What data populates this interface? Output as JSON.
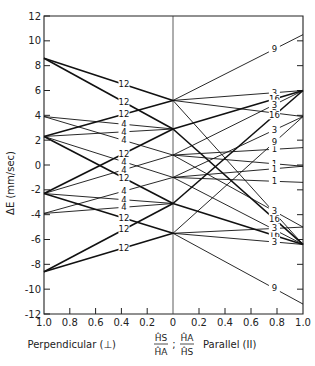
{
  "chart_data": {
    "type": "line",
    "title": "",
    "ylabel": "ΔE (mm/sec)",
    "xlabel": "Perpendicular (⊥)  ĤS/ĤA ; ĤA/ĤS  Parallel (II)",
    "xlabel_left": "Perpendicular (⊥)",
    "xlabel_ratio_left": {
      "num": "ĤS",
      "den": "ĤA"
    },
    "xlabel_sep": ";",
    "xlabel_ratio_right": {
      "num": "ĤA",
      "den": "ĤS"
    },
    "xlabel_right": "Parallel (II)",
    "ylim": [
      -12,
      12
    ],
    "yticks": [
      12,
      10,
      8,
      6,
      4,
      2,
      0,
      -2,
      -4,
      -6,
      -8,
      -10,
      -12
    ],
    "ytick_labels": [
      "12",
      "10",
      "8",
      "6",
      "4",
      "2",
      "0",
      "-2",
      "-4",
      "-6",
      "-8",
      "-10",
      "-12"
    ],
    "x_ticks_left": [
      "1.0",
      "0.8",
      "0.6",
      "0.4",
      "0.2"
    ],
    "x_center_label": "0",
    "x_ticks_right": [
      "0.2",
      "0.4",
      "0.6",
      "0.8",
      "1.0"
    ],
    "xlim": [
      -1.0,
      1.0
    ],
    "grid": false,
    "legend": "none",
    "center_line": true,
    "perpendicular_segments": [
      {
        "x": [
          -1.0,
          0
        ],
        "y": [
          8.6,
          5.2
        ],
        "label": "12",
        "weight": "heavy"
      },
      {
        "x": [
          -1.0,
          0
        ],
        "y": [
          8.6,
          2.9
        ],
        "label": "12",
        "weight": "heavy"
      },
      {
        "x": [
          -1.0,
          0
        ],
        "y": [
          3.9,
          2.9
        ],
        "label": "4",
        "weight": "light"
      },
      {
        "x": [
          -1.0,
          0
        ],
        "y": [
          3.9,
          0.8
        ],
        "label": "4",
        "weight": "light"
      },
      {
        "x": [
          -1.0,
          0
        ],
        "y": [
          2.3,
          5.2
        ],
        "label": "12",
        "weight": "heavy"
      },
      {
        "x": [
          -1.0,
          0
        ],
        "y": [
          2.3,
          2.9
        ],
        "label": "4",
        "weight": "light"
      },
      {
        "x": [
          -1.0,
          0
        ],
        "y": [
          2.3,
          -1.0
        ],
        "label": "4",
        "weight": "light"
      },
      {
        "x": [
          -1.0,
          0
        ],
        "y": [
          2.3,
          -3.1
        ],
        "label": "12",
        "weight": "heavy"
      },
      {
        "x": [
          -1.0,
          0
        ],
        "y": [
          -2.3,
          2.9
        ],
        "label": "12",
        "weight": "heavy"
      },
      {
        "x": [
          -1.0,
          0
        ],
        "y": [
          -2.3,
          0.8
        ],
        "label": "4",
        "weight": "light"
      },
      {
        "x": [
          -1.0,
          0
        ],
        "y": [
          -2.3,
          -3.1
        ],
        "label": "4",
        "weight": "light"
      },
      {
        "x": [
          -1.0,
          0
        ],
        "y": [
          -2.3,
          -5.5
        ],
        "label": "12",
        "weight": "heavy"
      },
      {
        "x": [
          -1.0,
          0
        ],
        "y": [
          -3.9,
          -1.0
        ],
        "label": "4",
        "weight": "light"
      },
      {
        "x": [
          -1.0,
          0
        ],
        "y": [
          -3.9,
          -3.1
        ],
        "label": "4",
        "weight": "light"
      },
      {
        "x": [
          -1.0,
          0
        ],
        "y": [
          -8.6,
          -3.1
        ],
        "label": "12",
        "weight": "heavy"
      },
      {
        "x": [
          -1.0,
          0
        ],
        "y": [
          -8.6,
          -5.5
        ],
        "label": "12",
        "weight": "heavy"
      }
    ],
    "parallel_segments": [
      {
        "x": [
          0,
          1.0
        ],
        "y": [
          5.2,
          10.5
        ],
        "label": "9",
        "weight": "light"
      },
      {
        "x": [
          0,
          1.0
        ],
        "y": [
          5.2,
          6.0
        ],
        "label": "3",
        "weight": "light"
      },
      {
        "x": [
          0,
          1.0
        ],
        "y": [
          5.2,
          3.9
        ],
        "label": "3",
        "weight": "light"
      },
      {
        "x": [
          0,
          1.0
        ],
        "y": [
          5.2,
          -6.4
        ],
        "label": "9",
        "weight": "light"
      },
      {
        "x": [
          0,
          1.0
        ],
        "y": [
          2.9,
          6.0
        ],
        "label": "16",
        "weight": "heavy"
      },
      {
        "x": [
          0,
          1.0
        ],
        "y": [
          2.9,
          -6.4
        ],
        "label": "16",
        "weight": "heavy"
      },
      {
        "x": [
          0,
          1.0
        ],
        "y": [
          0.8,
          1.4
        ],
        "label": "1",
        "weight": "light"
      },
      {
        "x": [
          0,
          1.0
        ],
        "y": [
          0.8,
          -0.1
        ],
        "label": "1",
        "weight": "light"
      },
      {
        "x": [
          0,
          1.0
        ],
        "y": [
          0.8,
          6.0
        ],
        "label": "3",
        "weight": "light"
      },
      {
        "x": [
          0,
          1.0
        ],
        "y": [
          0.8,
          -5.0
        ],
        "label": "3",
        "weight": "light"
      },
      {
        "x": [
          0,
          1.0
        ],
        "y": [
          -1.0,
          -0.1
        ],
        "label": "1",
        "weight": "light"
      },
      {
        "x": [
          0,
          1.0
        ],
        "y": [
          -1.0,
          -1.4
        ],
        "label": "1",
        "weight": "light"
      },
      {
        "x": [
          0,
          1.0
        ],
        "y": [
          -1.0,
          3.9
        ],
        "label": "3",
        "weight": "light"
      },
      {
        "x": [
          0,
          1.0
        ],
        "y": [
          -1.0,
          -6.4
        ],
        "label": "3",
        "weight": "light"
      },
      {
        "x": [
          0,
          1.0
        ],
        "y": [
          -3.1,
          6.0
        ],
        "label": "16",
        "weight": "heavy"
      },
      {
        "x": [
          0,
          1.0
        ],
        "y": [
          -3.1,
          -6.4
        ],
        "label": "16",
        "weight": "heavy"
      },
      {
        "x": [
          0,
          1.0
        ],
        "y": [
          -5.5,
          3.9
        ],
        "label": "9",
        "weight": "light"
      },
      {
        "x": [
          0,
          1.0
        ],
        "y": [
          -5.5,
          -5.0
        ],
        "label": "3",
        "weight": "light"
      },
      {
        "x": [
          0,
          1.0
        ],
        "y": [
          -5.5,
          -6.4
        ],
        "label": "3",
        "weight": "light"
      },
      {
        "x": [
          0,
          1.0
        ],
        "y": [
          -5.5,
          -11.2
        ],
        "label": "9",
        "weight": "light"
      }
    ],
    "right_axis_minor_ticks_y": [
      10,
      8,
      6,
      4,
      2,
      0,
      -2,
      -4,
      -6,
      -8,
      -10
    ]
  }
}
